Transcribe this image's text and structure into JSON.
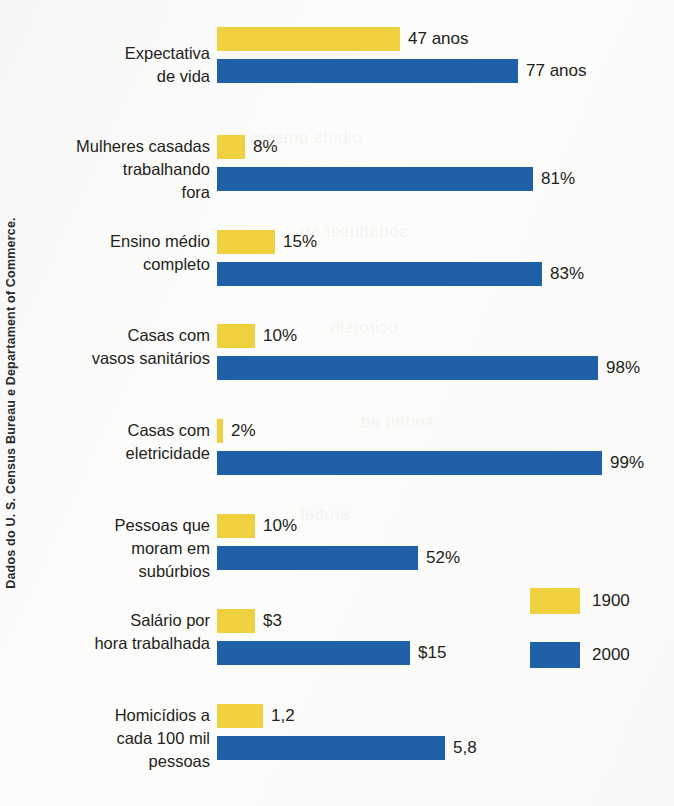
{
  "credit": {
    "text": "Dados do U. S. Census Bureau e Departament of Commerce."
  },
  "legend": {
    "items": [
      {
        "label": "1900",
        "color": "#efd140",
        "swatch_name": "legend-swatch-1900"
      },
      {
        "label": "2000",
        "color": "#2060a8",
        "swatch_name": "legend-swatch-2000"
      }
    ]
  },
  "ghosts": [
    {
      "text": "oibuts omsem",
      "left": 250,
      "top": 128
    },
    {
      "text": "sodatluser so",
      "left": 300,
      "top": 222
    },
    {
      "text": "ocirotsih",
      "left": 330,
      "top": 318
    },
    {
      "text": "sodad ed",
      "left": 360,
      "top": 412
    },
    {
      "text": "arutiel",
      "left": 300,
      "top": 505
    }
  ],
  "chart_data": {
    "type": "bar",
    "orientation": "horizontal",
    "title": "",
    "subtitle": "",
    "xlabel": "",
    "ylabel": "",
    "grid": false,
    "legend_position": "right-bottom",
    "series": [
      {
        "name": "1900",
        "color": "#efd140"
      },
      {
        "name": "2000",
        "color": "#2060a8"
      }
    ],
    "categories": [
      "Expectativa\nde vida",
      "Mulheres casadas\ntrabalhando\nfora",
      "Ensino médio\ncompleto",
      "Casas com\nvasos sanitários",
      "Casas com\neletricidade",
      "Pessoas que\nmoram em\nsubúrbios",
      "Salário por\nhora trabalhada",
      "Homicídios a\ncada 100 mil\npessoas"
    ],
    "rows": [
      {
        "label": "Expectativa\nde vida",
        "top": 27,
        "label_top": 42,
        "name": "row-expectativa-de-vida",
        "bars": [
          {
            "series": "1900",
            "value": 47,
            "unit": "anos",
            "value_label": "47 anos",
            "px": 183
          },
          {
            "series": "2000",
            "value": 77,
            "unit": "anos",
            "value_label": "77 anos",
            "px": 301
          }
        ]
      },
      {
        "label": "Mulheres casadas\ntrabalhando\nfora",
        "top": 135,
        "label_top": 135,
        "name": "row-mulheres-casadas-trabalhando-fora",
        "bars": [
          {
            "series": "1900",
            "value": 8,
            "unit": "%",
            "value_label": "8%",
            "px": 28
          },
          {
            "series": "2000",
            "value": 81,
            "unit": "%",
            "value_label": "81%",
            "px": 316
          }
        ]
      },
      {
        "label": "Ensino médio\ncompleto",
        "top": 230,
        "label_top": 230,
        "name": "row-ensino-medio-completo",
        "bars": [
          {
            "series": "1900",
            "value": 15,
            "unit": "%",
            "value_label": "15%",
            "px": 58
          },
          {
            "series": "2000",
            "value": 83,
            "unit": "%",
            "value_label": "83%",
            "px": 325
          }
        ]
      },
      {
        "label": "Casas com\nvasos sanitários",
        "top": 324,
        "label_top": 324,
        "name": "row-casas-com-vasos-sanitarios",
        "bars": [
          {
            "series": "1900",
            "value": 10,
            "unit": "%",
            "value_label": "10%",
            "px": 38
          },
          {
            "series": "2000",
            "value": 98,
            "unit": "%",
            "value_label": "98%",
            "px": 381
          }
        ]
      },
      {
        "label": "Casas com\neletricidade",
        "top": 419,
        "label_top": 419,
        "name": "row-casas-com-eletricidade",
        "bars": [
          {
            "series": "1900",
            "value": 2,
            "unit": "%",
            "value_label": "2%",
            "px": 6
          },
          {
            "series": "2000",
            "value": 99,
            "unit": "%",
            "value_label": "99%",
            "px": 385
          }
        ]
      },
      {
        "label": "Pessoas que\nmoram em\nsubúrbios",
        "top": 514,
        "label_top": 514,
        "name": "row-pessoas-que-moram-em-suburbios",
        "bars": [
          {
            "series": "1900",
            "value": 10,
            "unit": "%",
            "value_label": "10%",
            "px": 38
          },
          {
            "series": "2000",
            "value": 52,
            "unit": "%",
            "value_label": "52%",
            "px": 201
          }
        ]
      },
      {
        "label": "Salário por\nhora trabalhada",
        "top": 609,
        "label_top": 609,
        "name": "row-salario-por-hora-trabalhada",
        "bars": [
          {
            "series": "1900",
            "value": 3,
            "unit": "$",
            "value_label": "$3",
            "px": 38
          },
          {
            "series": "2000",
            "value": 15,
            "unit": "$",
            "value_label": "$15",
            "px": 193
          }
        ]
      },
      {
        "label": "Homicídios a\ncada 100 mil\npessoas",
        "top": 704,
        "label_top": 704,
        "name": "row-homicidios-a-cada-100-mil-pessoas",
        "bars": [
          {
            "series": "1900",
            "value": 1.2,
            "unit": "",
            "value_label": "1,2",
            "px": 46
          },
          {
            "series": "2000",
            "value": 5.8,
            "unit": "",
            "value_label": "5,8",
            "px": 228
          }
        ]
      }
    ]
  }
}
